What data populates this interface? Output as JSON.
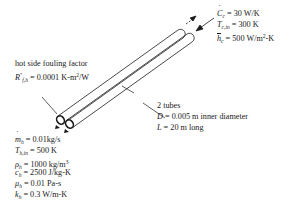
{
  "cold_side": {
    "capacitance_rate": {
      "symbol": "C",
      "sub": "c",
      "eq": " = ",
      "value": "30 W/K"
    },
    "inlet_temp": {
      "symbol": "T",
      "sub": "c,in",
      "eq": " = ",
      "value": "300 K"
    },
    "heat_transfer_coeff": {
      "symbol": "h",
      "sub": "c",
      "eq": " = ",
      "value": "500 W/m",
      "sup": "2",
      "unit_tail": "-K"
    }
  },
  "fouling": {
    "title": "hot side fouling factor",
    "symbol": "R",
    "sup": "″",
    "sub": "f,h",
    "eq": " = ",
    "value": "0.0001 K-m",
    "value_sup": "2",
    "value_tail": "/W"
  },
  "tubes": {
    "count": "2 tubes",
    "diameter": {
      "symbol": "D",
      "eq": " = ",
      "value": "0.005 m inner diameter"
    },
    "length": {
      "symbol": "L",
      "eq": " = ",
      "value": "20 m long"
    }
  },
  "hot_side": {
    "mass_flow": {
      "symbol": "m",
      "sub": "h",
      "eq": " = ",
      "value": "0.01kg/s"
    },
    "inlet_temp": {
      "symbol": "T",
      "sub": "h,in",
      "eq": " = ",
      "value": "500 K"
    },
    "density": {
      "symbol": "ρ",
      "sub": "h",
      "eq": " = ",
      "value": "1000 kg/m",
      "sup": "3"
    },
    "specific_heat": {
      "symbol": "c",
      "sub": "h",
      "eq": " = ",
      "value": "2500 J/kg-K"
    },
    "viscosity": {
      "symbol": "μ",
      "sub": "h",
      "eq": " = ",
      "value": "0.01 Pa-s"
    },
    "conductivity": {
      "symbol": "k",
      "sub": "h",
      "eq": " = ",
      "value": "0.3 W/m-K"
    }
  },
  "colors": {
    "ink": "#1a1a1a",
    "background": "#ffffff"
  }
}
